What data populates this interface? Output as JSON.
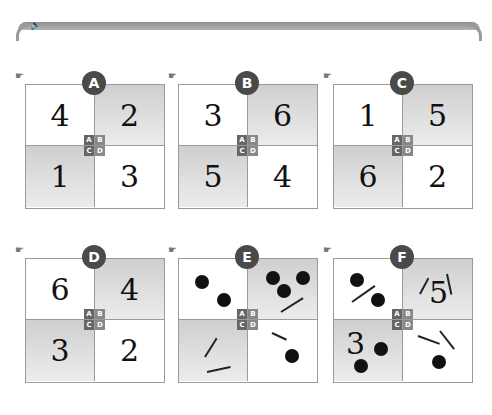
{
  "header": {
    "speaker_icon": "speaker-icon",
    "bar_color": "#9e9e9e"
  },
  "colors": {
    "badge": "#4a4a4a",
    "grid_line": "#9a9a9a",
    "gray_cell": "#d8d8d8",
    "ink": "#111111"
  },
  "key": {
    "a": "A",
    "b": "B",
    "c": "C",
    "d": "D"
  },
  "panels": [
    {
      "label": "A",
      "hand_icon": "pointing-hand-icon",
      "cells": {
        "a": "4",
        "b": "2",
        "c": "1",
        "d": "3"
      }
    },
    {
      "label": "B",
      "hand_icon": "pointing-hand-icon",
      "cells": {
        "a": "3",
        "b": "6",
        "c": "5",
        "d": "4"
      }
    },
    {
      "label": "C",
      "hand_icon": "pointing-hand-icon",
      "cells": {
        "a": "1",
        "b": "5",
        "c": "6",
        "d": "2"
      }
    },
    {
      "label": "D",
      "hand_icon": "pointing-hand-icon",
      "cells": {
        "a": "6",
        "b": "4",
        "c": "3",
        "d": "2"
      }
    },
    {
      "label": "E",
      "hand_icon": "pointing-hand-icon",
      "cells": {
        "a": {
          "dots": 2,
          "sticks": 0
        },
        "b": {
          "dots": 3,
          "sticks": 1
        },
        "c": {
          "dots": 0,
          "sticks": 2
        },
        "d": {
          "dots": 1,
          "sticks": 1
        }
      }
    },
    {
      "label": "F",
      "hand_icon": "pointing-hand-icon",
      "cells": {
        "a": {
          "dots": 2,
          "sticks": 1
        },
        "b": {
          "number": "5",
          "sticks": 2
        },
        "c": {
          "number": "3",
          "dots": 2
        },
        "d": {
          "dots": 1,
          "sticks": 2
        }
      }
    }
  ]
}
